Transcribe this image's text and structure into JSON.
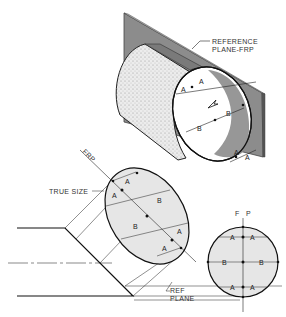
{
  "figure": {
    "type": "technical-drawing"
  },
  "labels": {
    "reference_plane_line1": "REFERENCE",
    "reference_plane_line2": "PLANE-FRP",
    "frp_axis": "FRP",
    "true_size": "TRUE SIZE",
    "ref_line1": "REF",
    "ref_line2": "PLANE",
    "fp_f": "F",
    "fp_p": "P"
  },
  "dimensions": {
    "a": "A",
    "b": "B"
  },
  "colors": {
    "plane_fill": "#8a8a8a",
    "plane_edge": "#5a5a5a",
    "ellipse_fill": "#e6e6e6",
    "cylinder_stipple": "#dcdcdc",
    "line": "#222222"
  }
}
